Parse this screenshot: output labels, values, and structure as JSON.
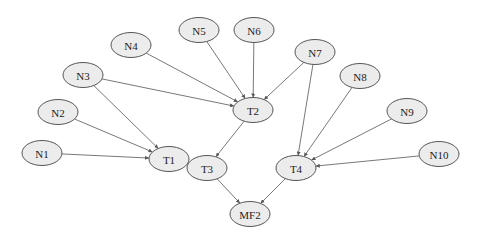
{
  "diagram": {
    "type": "directed-graph",
    "nodes": [
      {
        "id": "N1",
        "label": "N1",
        "x": 42,
        "y": 153
      },
      {
        "id": "N2",
        "label": "N2",
        "x": 58,
        "y": 112
      },
      {
        "id": "N3",
        "label": "N3",
        "x": 83,
        "y": 75
      },
      {
        "id": "N4",
        "label": "N4",
        "x": 131,
        "y": 45
      },
      {
        "id": "N5",
        "label": "N5",
        "x": 199,
        "y": 30
      },
      {
        "id": "N6",
        "label": "N6",
        "x": 254,
        "y": 30
      },
      {
        "id": "N7",
        "label": "N7",
        "x": 315,
        "y": 52
      },
      {
        "id": "N8",
        "label": "N8",
        "x": 360,
        "y": 76
      },
      {
        "id": "N9",
        "label": "N9",
        "x": 407,
        "y": 111
      },
      {
        "id": "N10",
        "label": "N10",
        "x": 439,
        "y": 154
      },
      {
        "id": "T1",
        "label": "T1",
        "x": 169,
        "y": 159
      },
      {
        "id": "T2",
        "label": "T2",
        "x": 253,
        "y": 110
      },
      {
        "id": "T3",
        "label": "T3",
        "x": 207,
        "y": 168
      },
      {
        "id": "T4",
        "label": "T4",
        "x": 296,
        "y": 168
      },
      {
        "id": "MF2",
        "label": "MF2",
        "x": 250,
        "y": 214
      }
    ],
    "edges": [
      {
        "from": "N1",
        "to": "T1"
      },
      {
        "from": "N2",
        "to": "T1"
      },
      {
        "from": "N3",
        "to": "T1"
      },
      {
        "from": "N3",
        "to": "T2"
      },
      {
        "from": "N4",
        "to": "T2"
      },
      {
        "from": "N5",
        "to": "T2"
      },
      {
        "from": "N6",
        "to": "T2"
      },
      {
        "from": "N7",
        "to": "T2"
      },
      {
        "from": "N7",
        "to": "T4"
      },
      {
        "from": "N8",
        "to": "T4"
      },
      {
        "from": "N9",
        "to": "T4"
      },
      {
        "from": "N10",
        "to": "T4"
      },
      {
        "from": "T1",
        "to": "T3"
      },
      {
        "from": "T2",
        "to": "T3"
      },
      {
        "from": "T3",
        "to": "MF2"
      },
      {
        "from": "T4",
        "to": "MF2"
      }
    ],
    "style": {
      "node_fill": "#ececec",
      "node_stroke": "#555555",
      "edge_color": "#555555"
    }
  }
}
